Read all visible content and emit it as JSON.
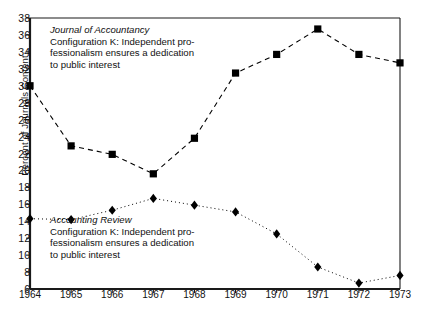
{
  "chart_data": {
    "type": "line",
    "title": "Configuration K",
    "xlabel": "",
    "ylabel": "Percent of Journals Content",
    "x": [
      1964,
      1965,
      1966,
      1967,
      1968,
      1969,
      1970,
      1971,
      1972,
      1973
    ],
    "xtick_labels": [
      "1964",
      "1965",
      "1966",
      "1967",
      "1968",
      "1969",
      "1970",
      "1971",
      "1972",
      "1973"
    ],
    "ytick_labels": [
      "38",
      "36",
      "34",
      "32",
      "30",
      "28",
      "26",
      "24",
      "22",
      "20",
      "18",
      "16",
      "14",
      "12",
      "10",
      "8",
      "6"
    ],
    "yticks": [
      38,
      36,
      34,
      32,
      30,
      28,
      26,
      24,
      22,
      20,
      18,
      16,
      14,
      12,
      10,
      8,
      6
    ],
    "xlim": [
      1964,
      1973
    ],
    "ylim": [
      6,
      38
    ],
    "grid": false,
    "legend": "annotations-inline",
    "series": [
      {
        "name": "Journal of Accountancy",
        "marker": "square",
        "linestyle": "dashed",
        "color": "#000000",
        "values": [
          30.0,
          22.9,
          21.9,
          19.6,
          23.8,
          31.5,
          33.7,
          36.7,
          33.7,
          32.7
        ]
      },
      {
        "name": "Accounting Review",
        "marker": "diamond",
        "linestyle": "dotted",
        "color": "#000000",
        "values": [
          14.3,
          14.2,
          15.3,
          16.7,
          15.9,
          15.1,
          12.5,
          8.6,
          6.7,
          7.6
        ]
      }
    ],
    "annotations": [
      {
        "id": "journal-of-accountancy",
        "title": "Journal of Accountancy",
        "lines": [
          "Configuration K: Independent pro-",
          "fessionalism ensures a dedication",
          "to public interest"
        ]
      },
      {
        "id": "accounting-review",
        "title": "Accounting Review",
        "lines": [
          "Configuration K: Independent pro-",
          "fessionalism ensures a dedication",
          "to public interest"
        ]
      }
    ]
  }
}
